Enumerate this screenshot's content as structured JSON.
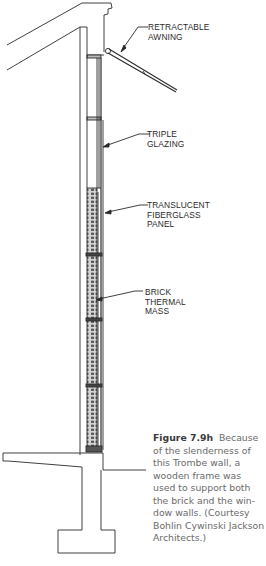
{
  "figure": {
    "type": "architectural section drawing",
    "labels": [
      {
        "id": "awning",
        "lines": [
          "RETRACTABLE",
          "AWNING"
        ]
      },
      {
        "id": "glazing",
        "lines": [
          "TRIPLE",
          "GLAZING"
        ]
      },
      {
        "id": "panel",
        "lines": [
          "TRANSLUCENT",
          "FIBERGLASS",
          "PANEL"
        ]
      },
      {
        "id": "brick",
        "lines": [
          "BRICK",
          "THERMAL",
          "MASS"
        ]
      }
    ],
    "caption": {
      "number": "Figure 7.9h",
      "text": "Because of the slenderness of this Trombe wall, a wooden frame was used  to support both the brick and the win-dow walls. (Courtesy Bohlin Cywinski Jackson Architects.)"
    },
    "colors": {
      "line": "#2a2a2a",
      "caption_text": "#6a6a6a",
      "caption_bold": "#3a3a3a",
      "background": "#ffffff"
    }
  }
}
